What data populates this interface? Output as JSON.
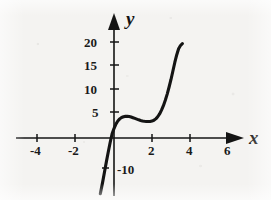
{
  "chart_data": {
    "type": "line",
    "title": "",
    "subtitle": "",
    "xlabel": "x",
    "ylabel": "y",
    "xlim": [
      -5.2,
      7.2
    ],
    "ylim": [
      -12.5,
      22.5
    ],
    "grid": false,
    "legend": null,
    "annotations": [],
    "x_ticks": [
      {
        "value": -4,
        "label": "-4"
      },
      {
        "value": -2,
        "label": "-2"
      },
      {
        "value": 2,
        "label": "2"
      },
      {
        "value": 4,
        "label": "4"
      },
      {
        "value": 6,
        "label": "6"
      }
    ],
    "y_ticks": [
      {
        "value": 20,
        "label": "20"
      },
      {
        "value": 15,
        "label": "15"
      },
      {
        "value": 10,
        "label": "10"
      },
      {
        "value": 5,
        "label": "5"
      },
      {
        "value": -10,
        "label": "-10"
      }
    ],
    "series": [
      {
        "name": "cubic curve",
        "color": "#141414",
        "x": [
          -0.72,
          -0.6,
          -0.5,
          -0.4,
          -0.3,
          -0.2,
          -0.1,
          0.0,
          0.1,
          0.2,
          0.3,
          0.4,
          0.5,
          0.6,
          0.7,
          0.8,
          0.9,
          1.0,
          1.1,
          1.2,
          1.3,
          1.4,
          1.5,
          1.6,
          1.7,
          1.8,
          1.9,
          2.0,
          2.1,
          2.2,
          2.3,
          2.4,
          2.5,
          2.6,
          2.7,
          2.8,
          2.9,
          3.0,
          3.1,
          3.2,
          3.3,
          3.4,
          3.5,
          3.6
        ],
        "y": [
          -11.8,
          -9.4,
          -7.2,
          -5.0,
          -2.9,
          -0.9,
          0.9,
          2.0,
          2.95,
          3.6,
          4.05,
          4.35,
          4.5,
          4.58,
          4.6,
          4.55,
          4.45,
          4.3,
          4.15,
          4.0,
          3.85,
          3.72,
          3.62,
          3.55,
          3.5,
          3.48,
          3.5,
          3.58,
          3.75,
          4.05,
          4.5,
          5.1,
          5.9,
          6.85,
          8.0,
          9.3,
          10.8,
          12.4,
          14.2,
          16.0,
          17.6,
          18.9,
          19.6,
          20.0
        ]
      }
    ],
    "features": {
      "local_maximum": {
        "x": 0.7,
        "y": 4.6
      },
      "local_minimum": {
        "x": 1.8,
        "y": 3.48
      },
      "curve_start": {
        "x": -0.72,
        "y": -11.8
      },
      "curve_end": {
        "x": 3.6,
        "y": 20.0
      }
    }
  },
  "axes": {
    "x_name": "x",
    "y_name": "y",
    "axis_color": "#141414"
  }
}
